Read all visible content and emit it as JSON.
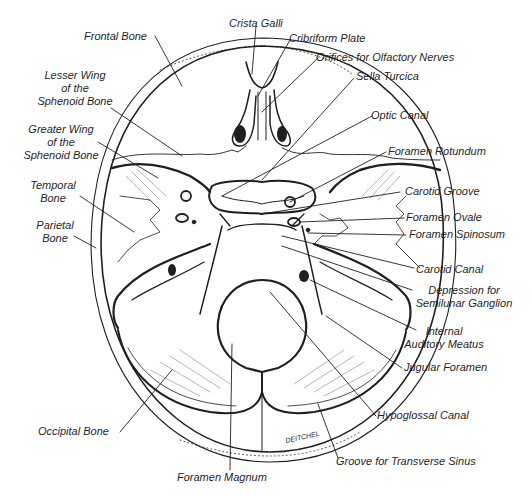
{
  "diagram": {
    "colors": {
      "ink": "#1f1f1f",
      "paper": "#ffffff"
    },
    "signature": "DEITCHEL",
    "labels_left": [
      {
        "id": "frontal-bone",
        "lines": [
          "Frontal Bone"
        ]
      },
      {
        "id": "lesser-wing",
        "lines": [
          "Lesser Wing",
          "of the",
          "Sphenoid Bone"
        ]
      },
      {
        "id": "greater-wing",
        "lines": [
          "Greater Wing",
          "of the",
          "Sphenoid Bone"
        ]
      },
      {
        "id": "temporal-bone",
        "lines": [
          "Temporal",
          "Bone"
        ]
      },
      {
        "id": "parietal-bone",
        "lines": [
          "Parietal",
          "Bone"
        ]
      },
      {
        "id": "occipital-bone",
        "lines": [
          "Occipital Bone"
        ]
      }
    ],
    "labels_top": [
      {
        "id": "crista-galli",
        "lines": [
          "Crista Galli"
        ]
      }
    ],
    "labels_right": [
      {
        "id": "cribriform-plate",
        "lines": [
          "Cribriform Plate"
        ]
      },
      {
        "id": "olfactory-orifices",
        "lines": [
          "Orifices for Olfactory Nerves"
        ]
      },
      {
        "id": "sella-turcica",
        "lines": [
          "Sella Turcica"
        ]
      },
      {
        "id": "optic-canal",
        "lines": [
          "Optic Canal"
        ]
      },
      {
        "id": "foramen-rotundum",
        "lines": [
          "Foramen Rotundum"
        ]
      },
      {
        "id": "carotid-groove",
        "lines": [
          "Carotid Groove"
        ]
      },
      {
        "id": "foramen-ovale",
        "lines": [
          "Foramen Ovale"
        ]
      },
      {
        "id": "foramen-spinosum",
        "lines": [
          "Foramen Spinosum"
        ]
      },
      {
        "id": "carotid-canal",
        "lines": [
          "Carotid Canal"
        ]
      },
      {
        "id": "semilunar-depression",
        "lines": [
          "Depression for",
          "Semilunar Ganglion"
        ]
      },
      {
        "id": "internal-auditory-meatus",
        "lines": [
          "Internal",
          "Auditory Meatus"
        ]
      },
      {
        "id": "jugular-foramen",
        "lines": [
          "Jugular Foramen"
        ]
      },
      {
        "id": "hypoglossal-canal",
        "lines": [
          "Hypoglossal Canal"
        ]
      },
      {
        "id": "transverse-sinus-groove",
        "lines": [
          "Groove for Transverse Sinus"
        ]
      }
    ],
    "labels_bottom": [
      {
        "id": "foramen-magnum",
        "lines": [
          "Foramen Magnum"
        ]
      }
    ]
  }
}
